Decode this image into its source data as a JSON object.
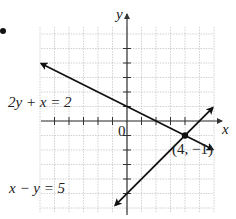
{
  "figure": {
    "bullet": "•",
    "axes": {
      "x_label": "x",
      "y_label": "y",
      "origin_label": "0",
      "xlim": [
        -6,
        6
      ],
      "ylim": [
        -6,
        6
      ],
      "grid": true,
      "tick_spacing": 1
    },
    "lines": [
      {
        "equation": "2y + x = 2",
        "label": "2y + x = 2",
        "slope": -0.5,
        "intercept": 1
      },
      {
        "equation": "x − y = 5",
        "label": "x − y = 5",
        "slope": 1,
        "intercept": -5
      }
    ],
    "intersection": {
      "label": "(4, −1)",
      "x": 4,
      "y": -1
    },
    "colors": {
      "line": "#111111",
      "grid": "#bdbdbd",
      "axis": "#333333"
    }
  },
  "chart_data": {
    "type": "line",
    "title": "",
    "xlabel": "x",
    "ylabel": "y",
    "xlim": [
      -6,
      6
    ],
    "ylim": [
      -6,
      6
    ],
    "grid": true,
    "series": [
      {
        "name": "2y + x = 2",
        "x": [
          -5.9,
          5.9
        ],
        "y": [
          3.95,
          -1.95
        ]
      },
      {
        "name": "x − y = 5",
        "x": [
          -0.8,
          5.9
        ],
        "y": [
          -5.8,
          0.9
        ]
      }
    ],
    "annotations": [
      {
        "text": "(4, −1)",
        "x": 4,
        "y": -1,
        "marker": "point"
      },
      {
        "text": "0",
        "x": 0,
        "y": 0
      }
    ]
  }
}
